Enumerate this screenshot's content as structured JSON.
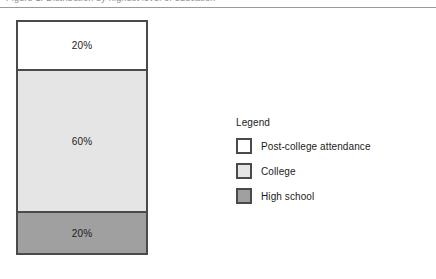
{
  "header": {
    "clipped_text": "Figure 1. Distribution by highest level of education"
  },
  "legend": {
    "title": "Legend",
    "items": [
      {
        "label": "Post-college attendance",
        "swatch": "white-swatch",
        "color": "#ffffff"
      },
      {
        "label": "College",
        "swatch": "light-gray-swatch",
        "color": "#e5e5e5"
      },
      {
        "label": "High school",
        "swatch": "medium-gray-swatch",
        "color": "#a0a0a0"
      }
    ]
  },
  "chart_data": {
    "type": "bar",
    "title": "",
    "xlabel": "",
    "ylabel": "",
    "orientation": "vertical",
    "stacked": true,
    "grid": false,
    "legend_position": "right",
    "categories": [
      ""
    ],
    "series": [
      {
        "name": "Post-college attendance",
        "values": [
          20
        ],
        "label": "20%",
        "color": "#ffffff"
      },
      {
        "name": "College",
        "values": [
          60
        ],
        "label": "60%",
        "color": "#e5e5e5"
      },
      {
        "name": "High school",
        "values": [
          20
        ],
        "label": "20%",
        "color": "#a0a0a0"
      }
    ],
    "segments_top_to_bottom": [
      {
        "name": "Post-college attendance",
        "value": 20,
        "label": "20%",
        "color": "#ffffff"
      },
      {
        "name": "College",
        "value": 60,
        "label": "60%",
        "color": "#e5e5e5"
      },
      {
        "name": "High school",
        "value": 20,
        "label": "20%",
        "color": "#a0a0a0"
      }
    ],
    "ylim": [
      0,
      100
    ],
    "unit": "%",
    "total": 100,
    "border_color": "#4a4a4a"
  }
}
